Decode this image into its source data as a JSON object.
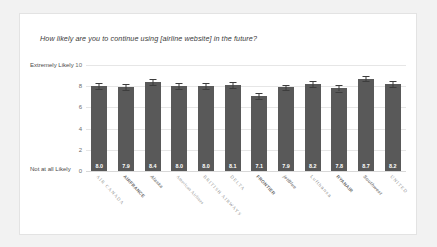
{
  "card": {
    "title": "How likely are you to continue using [airline website] in the future?"
  },
  "axis": {
    "top_label": "Extremely Likely",
    "bottom_label": "Not at all Likely"
  },
  "chart_data": {
    "type": "bar",
    "title": "How likely are you to continue using [airline website] in the future?",
    "xlabel": "",
    "ylabel": "",
    "ylim": [
      0,
      10
    ],
    "yticks": [
      "0",
      "2",
      "4",
      "6",
      "8",
      "10"
    ],
    "ytick_values": [
      0,
      2,
      4,
      6,
      8,
      10
    ],
    "grid": true,
    "legend": "none",
    "bar_color": "#595959",
    "error_bar_color": "#3d3d3d",
    "y_axis_top_annotation": "Extremely Likely",
    "y_axis_bottom_annotation": "Not at all Likely",
    "categories": [
      "AIR CANADA",
      "AIRFRANCE",
      "Alaska",
      "American Airlines",
      "BRITISH AIRWAYS",
      "DELTA",
      "FRONTIER",
      "jetBlue",
      "Lufthansa",
      "RYANAIR",
      "Southwest",
      "UNITED"
    ],
    "values": [
      8.0,
      7.9,
      8.4,
      8.0,
      8.0,
      8.1,
      7.1,
      7.9,
      8.2,
      7.8,
      8.7,
      8.2
    ],
    "value_labels": [
      "8.0",
      "7.9",
      "8.4",
      "8.0",
      "8.0",
      "8.1",
      "7.1",
      "7.9",
      "8.2",
      "7.8",
      "8.7",
      "8.2"
    ],
    "errors": [
      0.26,
      0.27,
      0.26,
      0.26,
      0.26,
      0.28,
      0.29,
      0.26,
      0.26,
      0.3,
      0.25,
      0.27
    ]
  }
}
